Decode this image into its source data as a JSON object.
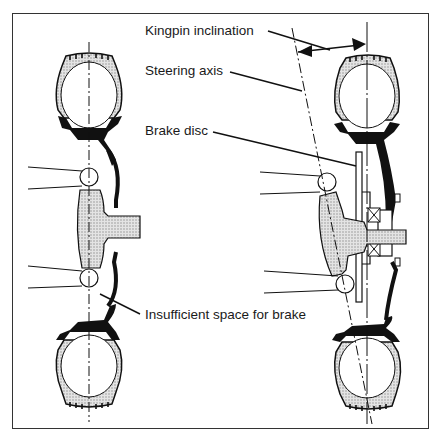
{
  "figure": {
    "labels": {
      "kingpin_inclination": "Kingpin inclination",
      "steering_axis": "Steering axis",
      "brake_disc": "Brake disc",
      "insufficient_space": "Insufficient space for brake"
    },
    "panels": [
      {
        "id": "left",
        "description": "Vertical steering axis, no room for brake"
      },
      {
        "id": "right",
        "description": "Inclined steering axis with brake disc and hub bearing"
      }
    ],
    "colors": {
      "line": "#111111",
      "hatch": "#bdbdbd",
      "background": "#ffffff"
    }
  }
}
